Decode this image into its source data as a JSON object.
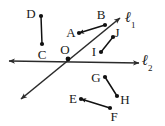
{
  "figure": {
    "width": 165,
    "height": 126,
    "background_color": "#ffffff",
    "stroke_color": "#2b2b2b",
    "dot_color": "#111111"
  },
  "lines": [
    {
      "id": "l1",
      "label": "ℓ",
      "subscript": "1",
      "label_x": 130,
      "label_y": 20,
      "x1": 21,
      "y1": 99,
      "x2": 120,
      "y2": 18,
      "arrow_start": true,
      "arrow_end": true,
      "description": "line l1 rising from lower-left to upper-right through O"
    },
    {
      "id": "l2",
      "label": "ℓ",
      "subscript": "2",
      "label_x": 147,
      "label_y": 63,
      "x1": 9,
      "y1": 61,
      "x2": 139,
      "y2": 63,
      "arrow_start": true,
      "arrow_end": true,
      "description": "line l2 running left to right through O"
    }
  ],
  "points": [
    {
      "name": "D",
      "dot_x": 41,
      "dot_y": 16,
      "label_x": 31,
      "label_y": 13
    },
    {
      "name": "C",
      "dot_x": 42,
      "dot_y": 44,
      "label_x": 42,
      "label_y": 54
    },
    {
      "name": "A",
      "dot_x": 79,
      "dot_y": 33,
      "label_x": 71,
      "label_y": 32
    },
    {
      "name": "B",
      "dot_x": 105,
      "dot_y": 25,
      "label_x": 101,
      "label_y": 14
    },
    {
      "name": "O",
      "dot_x": 68,
      "dot_y": 59,
      "label_x": 65,
      "label_y": 49
    },
    {
      "name": "I",
      "dot_x": 101,
      "dot_y": 52,
      "label_x": 94,
      "label_y": 51
    },
    {
      "name": "J",
      "dot_x": 113,
      "dot_y": 37,
      "label_x": 117,
      "label_y": 32
    },
    {
      "name": "G",
      "dot_x": 105,
      "dot_y": 77,
      "label_x": 96,
      "label_y": 77
    },
    {
      "name": "H",
      "dot_x": 117,
      "dot_y": 96,
      "label_x": 125,
      "label_y": 99
    },
    {
      "name": "E",
      "dot_x": 81,
      "dot_y": 99,
      "label_x": 73,
      "label_y": 98
    },
    {
      "name": "F",
      "dot_x": 110,
      "dot_y": 108,
      "label_x": 114,
      "label_y": 116
    }
  ],
  "segments": [
    {
      "id": "DC",
      "from": "D",
      "to": "C",
      "x1": 41,
      "y1": 16,
      "x2": 42,
      "y2": 44
    },
    {
      "id": "AB",
      "from": "A",
      "to": "B",
      "x1": 79,
      "y1": 33,
      "x2": 105,
      "y2": 25,
      "arrow_at_from": true
    },
    {
      "id": "IJ",
      "from": "I",
      "to": "J",
      "x1": 101,
      "y1": 52,
      "x2": 113,
      "y2": 37
    },
    {
      "id": "GH",
      "from": "G",
      "to": "H",
      "x1": 105,
      "y1": 77,
      "x2": 117,
      "y2": 96
    },
    {
      "id": "EF",
      "from": "E",
      "to": "F",
      "x1": 81,
      "y1": 99,
      "x2": 110,
      "y2": 108,
      "arrow_at_from": true
    }
  ]
}
